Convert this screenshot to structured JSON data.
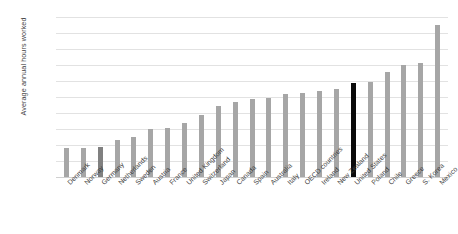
{
  "chart_data": {
    "type": "bar",
    "title": "",
    "xlabel": "",
    "ylabel": "Average annual hours worked",
    "ylim": [
      1200,
      2200
    ],
    "ytick_step": 100,
    "grid": true,
    "legend": "none",
    "yticks": [
      "2,200",
      "2,100",
      "2,000",
      "1,900",
      "1,800",
      "1,700",
      "1,600",
      "1,500",
      "1,400",
      "1,300",
      "1,200"
    ],
    "categories": [
      "Denmark",
      "Norway",
      "Germany",
      "Netherlands",
      "Sweden",
      "Austria",
      "France",
      "United Kingdom",
      "Switzerland",
      "Japan",
      "Canada",
      "Spain",
      "Australia",
      "Italy",
      "OECD countries",
      "Ireland",
      "New Zealand",
      "United States",
      "Poland",
      "Chile",
      "Greece",
      "S. Korea",
      "Mexico"
    ],
    "values": [
      1380,
      1384,
      1386,
      1430,
      1452,
      1501,
      1505,
      1538,
      1590,
      1644,
      1670,
      1687,
      1695,
      1718,
      1726,
      1738,
      1752,
      1786,
      1792,
      1858,
      1900,
      1915,
      2148
    ],
    "bar_styles": [
      "normal",
      "normal",
      "dark",
      "normal",
      "normal",
      "normal",
      "normal",
      "normal",
      "normal",
      "normal",
      "normal",
      "normal",
      "normal",
      "normal",
      "normal",
      "normal",
      "normal",
      "highlight",
      "normal",
      "normal",
      "normal",
      "normal",
      "normal"
    ],
    "colors": {
      "bar": "#a6a6a6",
      "bar_dark": "#808080",
      "bar_highlight": "#0a0a0a",
      "gridline": "#e2e2e2",
      "text": "#3f3f3f",
      "background": "#ffffff"
    }
  }
}
